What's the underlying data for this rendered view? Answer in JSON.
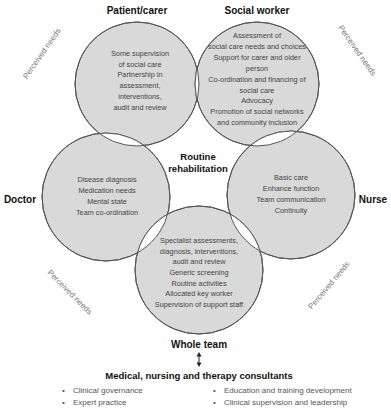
{
  "diagram": {
    "center_label": [
      "Routine",
      "rehabilitation"
    ],
    "circles": [
      {
        "role": "Patient/carer",
        "items": [
          "Some supervision",
          "of social care",
          "Partnership in",
          "assessment,",
          "interventions,",
          "audit and review"
        ]
      },
      {
        "role": "Social worker",
        "items": [
          "Assessment of",
          "social care needs and choices",
          "Support for carer and older",
          "person",
          "Co-ordination and financing of",
          "social care",
          "Advocacy",
          "Promotion of social networks",
          "and community inclusion"
        ]
      },
      {
        "role": "Doctor",
        "items": [
          "Disease diagnosis",
          "Medication needs",
          "Mental state",
          "Team co-ordination"
        ]
      },
      {
        "role": "Nurse",
        "items": [
          "Basic care",
          "Enhance function",
          "Team communication",
          "Continuity"
        ]
      },
      {
        "role": "Whole team",
        "items": [
          "Specialist assessments,",
          "diagnosis, interventions,",
          "audit and review",
          "Generic screening",
          "Routine activities",
          "Allocated key worker",
          "Supervision of support staff"
        ]
      }
    ],
    "perceived_needs_label": "Perceived needs",
    "consultants": {
      "title": "Medical, nursing and therapy consultants",
      "left_bullets": [
        "Clinical governance",
        "Expert practice"
      ],
      "right_bullets": [
        "Education and training development",
        "Clinical supervision and leadership"
      ]
    },
    "colors": {
      "circle_fill": "#d9d9d9",
      "circle_stroke": "#555555",
      "overlap_fill": "#ffffff"
    }
  }
}
